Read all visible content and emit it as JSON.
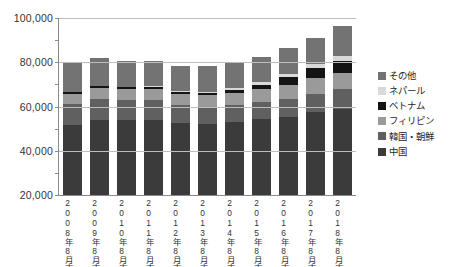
{
  "chart_data": {
    "type": "bar",
    "title": "",
    "subtitle": "",
    "xlabel": "",
    "ylabel": "",
    "stacked": true,
    "grid": true,
    "legend_position": "right",
    "ylim": [
      20000,
      100000
    ],
    "y_ticks": [
      20000,
      40000,
      60000,
      80000,
      100000
    ],
    "y_tick_labels": [
      "20,000",
      "40,000",
      "60,000",
      "80,000",
      "100,000"
    ],
    "y_minor_ticks": [
      30000,
      50000,
      70000,
      90000
    ],
    "categories": [
      "2008年8月末",
      "2009年8月末",
      "2010年8月末",
      "2011年8月末",
      "2012年8月末",
      "2013年8月末",
      "2014年8月末",
      "2015年8月末",
      "2016年8月末",
      "2017年8月末",
      "2018年8月末"
    ],
    "series": [
      {
        "name": "中国",
        "color": "#3b3b3b",
        "values": [
          42000,
          44800,
          44900,
          45300,
          43600,
          43200,
          43900,
          45200,
          45900,
          47800,
          48900
        ]
      },
      {
        "name": "韓国・朝鮮",
        "color": "#606060",
        "values": [
          12800,
          12500,
          12200,
          11900,
          11200,
          10400,
          10300,
          10400,
          10600,
          10900,
          11700
        ]
      },
      {
        "name": "フィリピン",
        "color": "#9a9a9a",
        "values": [
          6300,
          6500,
          6400,
          6300,
          6600,
          6900,
          7300,
          7700,
          8300,
          8900,
          9000
        ]
      },
      {
        "name": "ベトナム",
        "color": "#141414",
        "values": [
          900,
          1200,
          1200,
          1200,
          1200,
          1300,
          1700,
          2500,
          4300,
          5800,
          7000
        ]
      },
      {
        "name": "ネパール",
        "color": "#d9d9d9",
        "values": [
          300,
          400,
          500,
          600,
          700,
          900,
          1100,
          1400,
          1800,
          2400,
          2800
        ]
      },
      {
        "name": "その他",
        "color": "#737373",
        "values": [
          17200,
          16600,
          15500,
          15100,
          15000,
          15600,
          15600,
          15100,
          15600,
          15200,
          16900
        ]
      }
    ],
    "totals": [
      79500,
      82000,
      80700,
      80400,
      78300,
      78300,
      79900,
      82300,
      86500,
      91000,
      96300
    ]
  },
  "bottom_caption": "",
  "legend": {
    "items": [
      {
        "label": "その他",
        "color": "#737373"
      },
      {
        "label": "ネパール",
        "color": "#d9d9d9"
      },
      {
        "label": "ベトナム",
        "color": "#141414"
      },
      {
        "label": "フィリピン",
        "color": "#9a9a9a"
      },
      {
        "label": "韓国・朝鮮",
        "color": "#606060"
      },
      {
        "label": "中国",
        "color": "#3b3b3b"
      }
    ]
  }
}
